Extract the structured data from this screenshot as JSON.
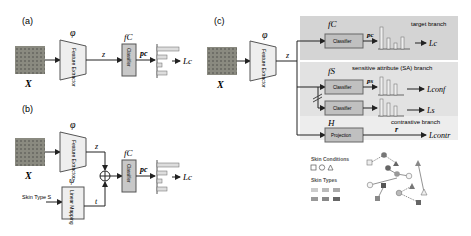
{
  "panels": {
    "a": {
      "label": "(a)",
      "input": "X",
      "encoder_symbol": "φ",
      "encoder_text": "Feature Extractor",
      "embedding": "z",
      "classifier_symbol": "fC",
      "classifier_text": "Classifier",
      "pred": "pc",
      "loss": "Lc"
    },
    "b": {
      "label": "(b)",
      "input": "X",
      "encoder_symbol": "φ",
      "encoder_text": "Feature Extractor",
      "embedding": "z",
      "side_input": "Skin Type S",
      "mapping_symbol": "ψ",
      "mapping_text": "Linear Mapping",
      "mapped": "t",
      "classifier_symbol": "fC",
      "classifier_text": "Classifier",
      "pred": "pc",
      "loss": "Lc"
    },
    "c": {
      "label": "(c)",
      "input": "X",
      "encoder_symbol": "φ",
      "encoder_text": "Feature Extractor",
      "embedding": "z",
      "target_branch": {
        "title": "target branch",
        "symbol": "fC",
        "module": "Classifier",
        "pred": "pc",
        "loss": "Lc"
      },
      "sa_branch": {
        "title": "sensitive attribute (SA) branch",
        "symbol": "fS",
        "module1": "Classifier",
        "pred": "ps",
        "loss1": "Lconf",
        "module2": "Classifier",
        "loss2": "Ls"
      },
      "contrastive_branch": {
        "title": "contrastive branch",
        "symbol": "H",
        "module": "Projection",
        "out": "r",
        "loss": "Lcontr"
      },
      "legend": {
        "conditions_title": "Skin Conditions",
        "types_title": "Skin Types"
      }
    }
  },
  "colors": {
    "panel_target": "#d4d4d4",
    "panel_sa": "#e2e2e2",
    "panel_contr": "#ededed",
    "module": "#c8c8c8",
    "encoder": "#eeeeee"
  }
}
